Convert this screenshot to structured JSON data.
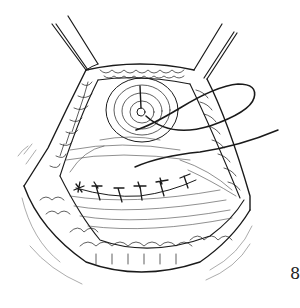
{
  "figure": {
    "label": "8",
    "colors": {
      "background": "#ffffff",
      "ink": "#1a1a1a",
      "light_ink": "#888888"
    }
  },
  "elements": {
    "retractors": [
      "left-retractor",
      "right-retractor"
    ],
    "suture_count": 6
  }
}
